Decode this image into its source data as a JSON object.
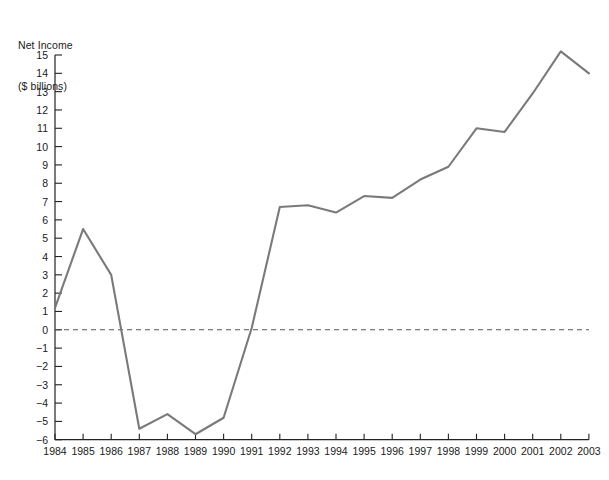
{
  "chart_data": {
    "type": "line",
    "title": "",
    "ylabel_line1": "Net Income",
    "ylabel_line2": "($ billions)",
    "xlabel": "",
    "ylim": [
      -6,
      15
    ],
    "grid": false,
    "legend": "none",
    "zero_line": true,
    "zero_line_style": "dashed",
    "line_color": "#7a7a7a",
    "axis_color": "#222222",
    "categories": [
      "1984",
      "1985",
      "1986",
      "1987",
      "1988",
      "1989",
      "1990",
      "1991",
      "1992",
      "1993",
      "1994",
      "1995",
      "1996",
      "1997",
      "1998",
      "1999",
      "2000",
      "2001",
      "2002",
      "2003"
    ],
    "values": [
      1.2,
      5.5,
      3.0,
      -5.4,
      -4.6,
      -5.7,
      -4.8,
      0.1,
      6.7,
      6.8,
      6.4,
      7.3,
      7.2,
      8.2,
      8.9,
      11.0,
      10.8,
      12.9,
      15.2,
      14.0
    ],
    "ytick_labels": [
      "15",
      "14",
      "13",
      "12",
      "11",
      "10",
      "9",
      "8",
      "7",
      "6",
      "5",
      "4",
      "3",
      "2",
      "1",
      "0",
      "−1",
      "−2",
      "−3",
      "−4",
      "−5",
      "−6"
    ],
    "ytick_values": [
      15,
      14,
      13,
      12,
      11,
      10,
      9,
      8,
      7,
      6,
      5,
      4,
      3,
      2,
      1,
      0,
      -1,
      -2,
      -3,
      -4,
      -5,
      -6
    ]
  }
}
